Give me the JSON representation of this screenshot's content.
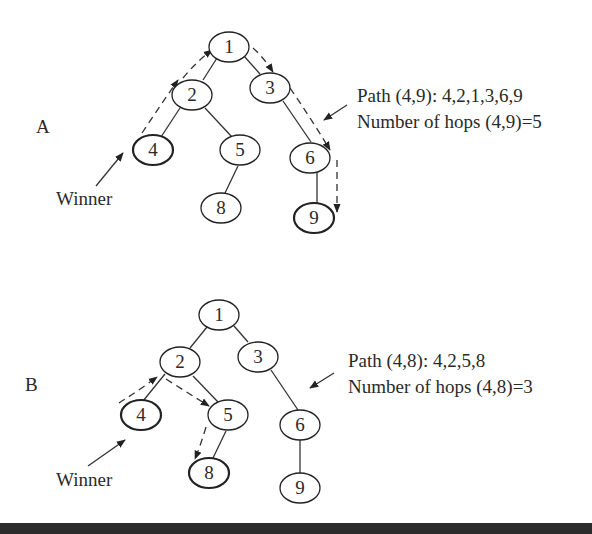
{
  "diagrams": [
    {
      "id": "A",
      "label": "A",
      "winner_label": "Winner",
      "path_text": "Path (4,9): 4,2,1,3,6,9",
      "hops_text": "Number of hops (4,9)=5",
      "nodes": [
        {
          "id": "1",
          "x": 229,
          "y": 47,
          "bold": false
        },
        {
          "id": "2",
          "x": 192,
          "y": 95,
          "bold": false
        },
        {
          "id": "3",
          "x": 270,
          "y": 88,
          "bold": false
        },
        {
          "id": "4",
          "x": 153,
          "y": 150,
          "bold": true
        },
        {
          "id": "5",
          "x": 240,
          "y": 150,
          "bold": false
        },
        {
          "id": "6",
          "x": 310,
          "y": 158,
          "bold": false
        },
        {
          "id": "8",
          "x": 221,
          "y": 208,
          "bold": false
        },
        {
          "id": "9",
          "x": 314,
          "y": 218,
          "bold": true
        }
      ],
      "edges": [
        [
          "1",
          "2"
        ],
        [
          "1",
          "3"
        ],
        [
          "2",
          "4"
        ],
        [
          "2",
          "5"
        ],
        [
          "5",
          "8"
        ],
        [
          "3",
          "6"
        ],
        [
          "6",
          "9"
        ]
      ],
      "path": [
        "4",
        "2",
        "1",
        "3",
        "6",
        "9"
      ]
    },
    {
      "id": "B",
      "label": "B",
      "winner_label": "Winner",
      "path_text": "Path (4,8): 4,2,5,8",
      "hops_text": "Number of hops (4,8)=3",
      "nodes": [
        {
          "id": "1",
          "x": 219,
          "y": 315,
          "bold": false
        },
        {
          "id": "2",
          "x": 180,
          "y": 362,
          "bold": false
        },
        {
          "id": "3",
          "x": 258,
          "y": 357,
          "bold": false
        },
        {
          "id": "4",
          "x": 141,
          "y": 415,
          "bold": true
        },
        {
          "id": "5",
          "x": 228,
          "y": 415,
          "bold": false
        },
        {
          "id": "6",
          "x": 300,
          "y": 425,
          "bold": false
        },
        {
          "id": "8",
          "x": 209,
          "y": 473,
          "bold": true
        },
        {
          "id": "9",
          "x": 300,
          "y": 488,
          "bold": false
        }
      ],
      "edges": [
        [
          "1",
          "2"
        ],
        [
          "1",
          "3"
        ],
        [
          "2",
          "4"
        ],
        [
          "2",
          "5"
        ],
        [
          "5",
          "8"
        ],
        [
          "3",
          "6"
        ],
        [
          "6",
          "9"
        ]
      ],
      "path": [
        "4",
        "2",
        "5",
        "8"
      ]
    }
  ]
}
